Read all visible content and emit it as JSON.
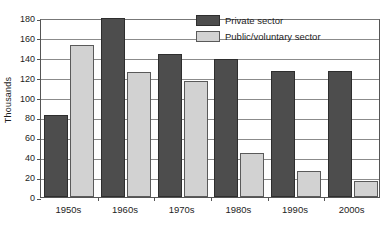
{
  "chart_data": {
    "type": "bar",
    "title": "",
    "xlabel": "",
    "ylabel": "Thousands",
    "categories": [
      "1950s",
      "1960s",
      "1970s",
      "1980s",
      "1990s",
      "2000s"
    ],
    "series": [
      {
        "name": "Private sector",
        "color": "#4d4d4d",
        "values": [
          82,
          180,
          144,
          139,
          127,
          127
        ]
      },
      {
        "name": "Public/voluntary sector",
        "color": "#d2d2d2",
        "values": [
          153,
          126,
          117,
          44,
          26,
          16
        ]
      }
    ],
    "ylim": [
      0,
      180
    ],
    "yticks": [
      0,
      20,
      40,
      60,
      80,
      100,
      120,
      140,
      160,
      180
    ],
    "ytick_labels": [
      "0",
      "20",
      "40",
      "60",
      "80",
      "100",
      "120",
      "140",
      "160",
      "180"
    ],
    "grid": true,
    "legend_position": "top-right"
  },
  "legend": {
    "entries": [
      {
        "label": "Private sector"
      },
      {
        "label": "Public/voluntary sector"
      }
    ]
  }
}
